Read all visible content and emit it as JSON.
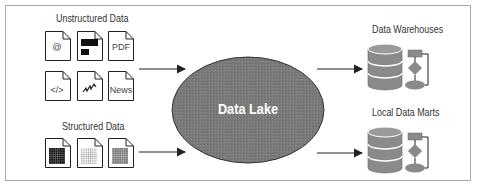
{
  "diagram": {
    "colors": {
      "border": "#a8a8a8",
      "lake_fill": "#7a7a7a",
      "lake_stroke": "#333333",
      "lake_text": "#ffffff",
      "db_fill": "#8a8a8a",
      "arrow": "#222222"
    },
    "sources": {
      "unstructured": {
        "title": "Unstructured Data",
        "docs": [
          {
            "icon": "email-icon",
            "label": "@"
          },
          {
            "icon": "image-doc-icon",
            "label": ""
          },
          {
            "icon": "pdf-icon",
            "label": "PDF"
          },
          {
            "icon": "code-icon",
            "label": "</>"
          },
          {
            "icon": "signal-icon",
            "label": ""
          },
          {
            "icon": "news-icon",
            "label": "News"
          }
        ]
      },
      "structured": {
        "title": "Structured Data",
        "docs": [
          {
            "icon": "dark-grid-icon"
          },
          {
            "icon": "light-grid-icon"
          },
          {
            "icon": "gray-grid-icon"
          }
        ]
      }
    },
    "center": {
      "label": "Data Lake"
    },
    "targets": [
      {
        "title": "Data Warehouses",
        "icon": "database-flow-icon"
      },
      {
        "title": "Local Data Marts",
        "icon": "database-flow-icon"
      }
    ]
  }
}
